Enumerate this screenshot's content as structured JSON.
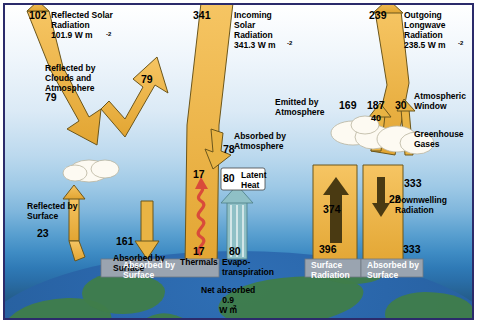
{
  "diagram": {
    "units": "W m-2",
    "colors": {
      "flux_yellow": "#f0b64a",
      "flux_yellow_dark": "#c8911f",
      "outline": "#5a4310",
      "cloud": "#fdfaf0",
      "ocean": "#2a66aa",
      "land": "#3f7d4a",
      "sky_top": "#ffffff",
      "sky_bottom": "#1f4f78",
      "latent_teal": "#7fb8c0",
      "thermals_red": "#d94b3a",
      "band_gray": "#9aa4b0",
      "border": "#2b2b6b"
    },
    "labels": {
      "reflected_solar": "Reflected Solar\nRadiation\n101.9 W m",
      "reflected_solar_value": "102",
      "reflected_by_clouds": "Reflected by\nClouds and\nAtmosphere",
      "reflected_by_clouds_value": "79",
      "reflected_by_clouds_arrow_value": "79",
      "incoming_solar": "Incoming\nSolar\nRadiation\n341.3 W m",
      "incoming_solar_value": "341",
      "absorbed_by_atmosphere": "Absorbed by\nAtmosphere",
      "absorbed_by_atmosphere_value": "78",
      "reflected_by_surface": "Reflected by\nSurface",
      "reflected_by_surface_value": "23",
      "absorbed_by_surface_in_value": "161",
      "absorbed_by_surface_in": "Absorbed by\nSurface",
      "thermals_value": "17",
      "thermals_label": "Thermals",
      "thermals_top_value": "17",
      "latent_heat": "Latent\nHeat",
      "latent_heat_value": "80",
      "evapotranspiration": "Evapo-\ntranspiration",
      "evapotranspiration_value": "80",
      "outgoing_longwave": "Outgoing\nLongwave\nRadiation\n238.5 W m",
      "outgoing_longwave_value": "239",
      "emitted_by_atmosphere": "Emitted by\nAtmosphere",
      "emitted_by_atmosphere_value": "169",
      "emitted_by_atmosphere_value2": "187",
      "atmospheric_window": "Atmospheric\nWindow",
      "atmospheric_window_value": "30",
      "atmospheric_window_value2": "40",
      "greenhouse_gases": "Greenhouse\nGases",
      "surface_radiation_value": "396",
      "surface_radiation": "Surface\nRadiation",
      "surface_up_value": "374",
      "back_rad_small_value": "22",
      "downwelling_radiation": "Downwelling\nRadiation",
      "downwelling_value": "333",
      "absorbed_by_surface_value": "333",
      "absorbed_by_surface": "Absorbed by\nSurface",
      "net_absorbed": "Net absorbed\n0.9\nW m",
      "sup": "-2"
    }
  }
}
